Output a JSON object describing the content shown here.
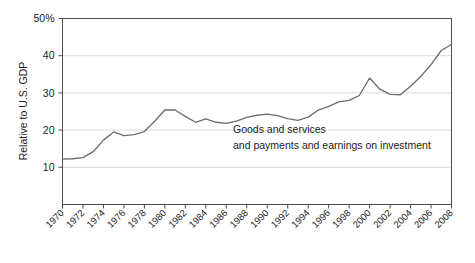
{
  "chart_data": {
    "type": "line",
    "title": "",
    "xlabel": "",
    "ylabel": "Relative to U.S. GDP",
    "xlim": [
      1970,
      2008
    ],
    "ylim": [
      0,
      50
    ],
    "grid": true,
    "legend_position": "none",
    "y_ticks": [
      10,
      20,
      30,
      40,
      50
    ],
    "y_tick_labels": [
      "10",
      "20",
      "30",
      "40",
      "50%"
    ],
    "x_ticks": [
      1970,
      1972,
      1974,
      1976,
      1978,
      1980,
      1982,
      1984,
      1986,
      1988,
      1990,
      1992,
      1994,
      1996,
      1998,
      2000,
      2002,
      2004,
      2006,
      2008
    ],
    "x_tick_labels": [
      "1970",
      "1972",
      "1974",
      "1976",
      "1978",
      "1980",
      "1982",
      "1984",
      "1986",
      "1988",
      "1990",
      "1992",
      "1994",
      "1996",
      "1998",
      "2000",
      "2002",
      "2004",
      "2006",
      "2008"
    ],
    "annotations": [
      {
        "text_line_1": "Goods and services",
        "text_line_2": "and payments and earnings on investment"
      }
    ],
    "series": [
      {
        "name": "Goods and services and payments and earnings on investment",
        "color": "#6e6e6e",
        "x": [
          1970,
          1971,
          1972,
          1973,
          1974,
          1975,
          1976,
          1977,
          1978,
          1979,
          1980,
          1981,
          1982,
          1983,
          1984,
          1985,
          1986,
          1987,
          1988,
          1989,
          1990,
          1991,
          1992,
          1993,
          1994,
          1995,
          1996,
          1997,
          1998,
          1999,
          2000,
          2001,
          2002,
          2003,
          2004,
          2005,
          2006,
          2007,
          2008
        ],
        "values": [
          12.2,
          12.3,
          12.6,
          14.2,
          17.3,
          19.5,
          18.5,
          18.8,
          19.6,
          22.4,
          25.4,
          25.4,
          23.7,
          22.1,
          23.0,
          22.1,
          21.8,
          22.4,
          23.4,
          24.0,
          24.3,
          23.9,
          23.1,
          22.6,
          23.5,
          25.4,
          26.4,
          27.6,
          28.0,
          29.3,
          34.0,
          31.0,
          29.6,
          29.5,
          31.8,
          34.4,
          37.6,
          41.4,
          43.0
        ]
      }
    ]
  },
  "colors": {
    "line": "#6e6e6e",
    "grid": "#cfcfcf",
    "frame": "#4d4d4d",
    "text": "#1c1c1c",
    "background": "#ffffff"
  }
}
